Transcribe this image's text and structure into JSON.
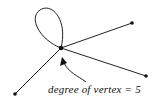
{
  "diagram": {
    "caption": "degree of vertex = 5",
    "central_vertex": {
      "x": 61,
      "y": 48
    },
    "vertices": [
      {
        "name": "top-right",
        "x": 132,
        "y": 23
      },
      {
        "name": "bottom-right",
        "x": 146,
        "y": 76
      },
      {
        "name": "bottom-left",
        "x": 15,
        "y": 94
      }
    ],
    "loop": true,
    "degree": 5,
    "stroke_color": "#222222"
  }
}
